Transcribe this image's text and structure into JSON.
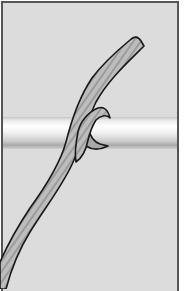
{
  "illustration": {
    "subject": "rope hitch around a horizontal rail",
    "colors": {
      "background": "#dcdcdc",
      "frame_border": "#555555",
      "rope_fill": "#b8b8b8",
      "rope_stripe": "#9a9a9a",
      "rope_outline": "#1a1a1a",
      "rail_highlight": "#ffffff",
      "rail_shadow": "#a9a9a9",
      "margin": "#ffffff"
    }
  }
}
